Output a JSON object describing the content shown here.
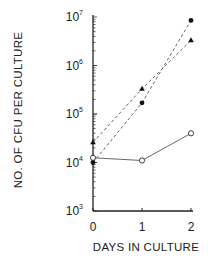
{
  "chart_data": {
    "type": "line",
    "title": "",
    "xlabel": "DAYS IN CULTURE",
    "ylabel": "NO. OF CFU PER CULTURE",
    "x": [
      0,
      1,
      2
    ],
    "x_tick_labels": [
      "0",
      "1",
      "2"
    ],
    "y_scale": "log",
    "ylim": [
      1000,
      10000000
    ],
    "y_tick_labels": [
      {
        "base": "10",
        "exp": "3"
      },
      {
        "base": "10",
        "exp": "4"
      },
      {
        "base": "10",
        "exp": "5"
      },
      {
        "base": "10",
        "exp": "6"
      },
      {
        "base": "10",
        "exp": "7"
      }
    ],
    "grid": false,
    "legend": null,
    "series": [
      {
        "name": "filled-circle (dashed)",
        "marker": "filled-circle",
        "line": "dashed",
        "values": [
          10000,
          170000,
          8500000
        ]
      },
      {
        "name": "filled-triangle (dashed)",
        "marker": "filled-triangle",
        "line": "dashed",
        "values": [
          26000,
          330000,
          3300000
        ]
      },
      {
        "name": "open-circle (solid)",
        "marker": "open-circle",
        "line": "solid",
        "values": [
          12500,
          11000,
          40000
        ]
      }
    ]
  },
  "colors": {
    "axis": "#222222",
    "line": "#555555",
    "marker": "#111111"
  }
}
